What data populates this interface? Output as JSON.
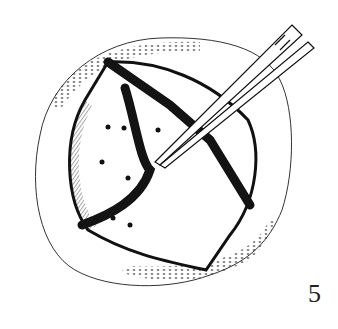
{
  "figure": {
    "number_label": "5",
    "colors": {
      "ink": "#111111",
      "background": "#ffffff"
    }
  }
}
